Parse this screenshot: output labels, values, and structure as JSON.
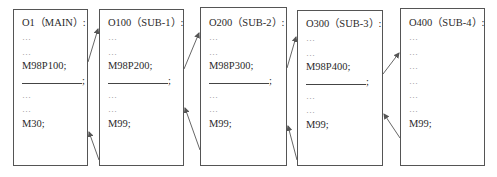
{
  "diagram": {
    "type": "subprogram-call-nesting",
    "boxes": [
      {
        "id": "main",
        "lines": [
          "O1（MAIN）:",
          "…",
          "…",
          "M98P100;",
          "BLANK",
          "…",
          "…",
          "M30;"
        ]
      },
      {
        "id": "sub1",
        "lines": [
          "O100（SUB-1）:",
          "…",
          "…",
          "M98P200;",
          "BLANK",
          "…",
          "…",
          "M99;"
        ]
      },
      {
        "id": "sub2",
        "lines": [
          "O200（SUB-2）:",
          "…",
          "…",
          "M98P300;",
          "BLANK",
          "…",
          "…",
          "M99;"
        ]
      },
      {
        "id": "sub3",
        "lines": [
          "O300（SUB-3）:",
          "…",
          "…",
          "M98P400;",
          "BLANK",
          "…",
          "…",
          "M99;"
        ]
      },
      {
        "id": "sub4",
        "lines": [
          "O400（SUB-4）:",
          "…",
          "…",
          "…",
          "…",
          "…",
          "…",
          "M99;"
        ]
      }
    ],
    "blank_suffix": ";",
    "arrows": [
      {
        "from": "main",
        "to": "sub1",
        "kind": "call"
      },
      {
        "from": "sub1",
        "to": "main",
        "kind": "return"
      },
      {
        "from": "sub1",
        "to": "sub2",
        "kind": "call"
      },
      {
        "from": "sub2",
        "to": "sub1",
        "kind": "return"
      },
      {
        "from": "sub2",
        "to": "sub3",
        "kind": "call"
      },
      {
        "from": "sub3",
        "to": "sub2",
        "kind": "return"
      },
      {
        "from": "sub3",
        "to": "sub4",
        "kind": "call"
      },
      {
        "from": "sub4",
        "to": "sub3",
        "kind": "return"
      }
    ],
    "colors": {
      "border": "#555555",
      "text": "#2a2a2a",
      "arrow": "#555555"
    }
  }
}
